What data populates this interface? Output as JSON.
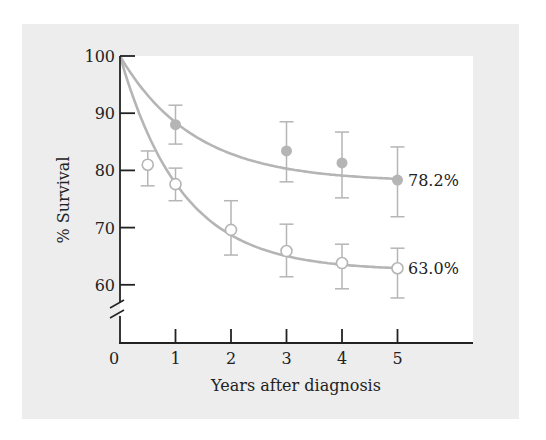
{
  "chart_data": {
    "type": "scatter",
    "title": "",
    "xlabel": "Years after diagnosis",
    "ylabel": "% Survival",
    "xlim": [
      0,
      6.2
    ],
    "ylim": [
      50,
      100
    ],
    "y_axis_break": true,
    "x_ticks": [
      0,
      1,
      2,
      3,
      4,
      5
    ],
    "y_ticks": [
      60,
      70,
      80,
      90,
      100
    ],
    "grid": false,
    "legend": null,
    "series": [
      {
        "name": "upper (filled circles)",
        "marker": "filled-circle",
        "color": "#b5b5b5",
        "points": [
          {
            "x": 1,
            "y": 88.0,
            "err_low": 84.6,
            "err_high": 91.4
          },
          {
            "x": 3,
            "y": 83.4,
            "err_low": 78.0,
            "err_high": 88.5
          },
          {
            "x": 4,
            "y": 81.3,
            "err_low": 75.2,
            "err_high": 86.7
          },
          {
            "x": 5,
            "y": 78.3,
            "err_low": 71.9,
            "err_high": 84.1
          }
        ],
        "fit_curve": {
          "form": "exp_decay",
          "start": 100,
          "asymptote": 78,
          "rate": 0.75
        },
        "end_label": "78.2%"
      },
      {
        "name": "lower (open circles)",
        "marker": "open-circle",
        "color": "#b5b5b5",
        "points": [
          {
            "x": 0.5,
            "y": 81.0,
            "err_low": 77.3,
            "err_high": 83.4
          },
          {
            "x": 1,
            "y": 77.6,
            "err_low": 74.7,
            "err_high": 80.4
          },
          {
            "x": 2,
            "y": 69.6,
            "err_low": 65.2,
            "err_high": 74.7
          },
          {
            "x": 3,
            "y": 65.9,
            "err_low": 61.4,
            "err_high": 70.6
          },
          {
            "x": 4,
            "y": 63.8,
            "err_low": 59.3,
            "err_high": 67.1
          },
          {
            "x": 5,
            "y": 62.9,
            "err_low": 57.7,
            "err_high": 66.4
          }
        ],
        "fit_curve": {
          "form": "exp_decay",
          "start": 100,
          "asymptote": 62.5,
          "rate": 0.9
        },
        "end_label": "63.0%"
      }
    ]
  },
  "colors": {
    "panel_background": "#ededed",
    "plot_background": "#ffffff",
    "axis": "#222222",
    "data": "#b5b5b5"
  }
}
